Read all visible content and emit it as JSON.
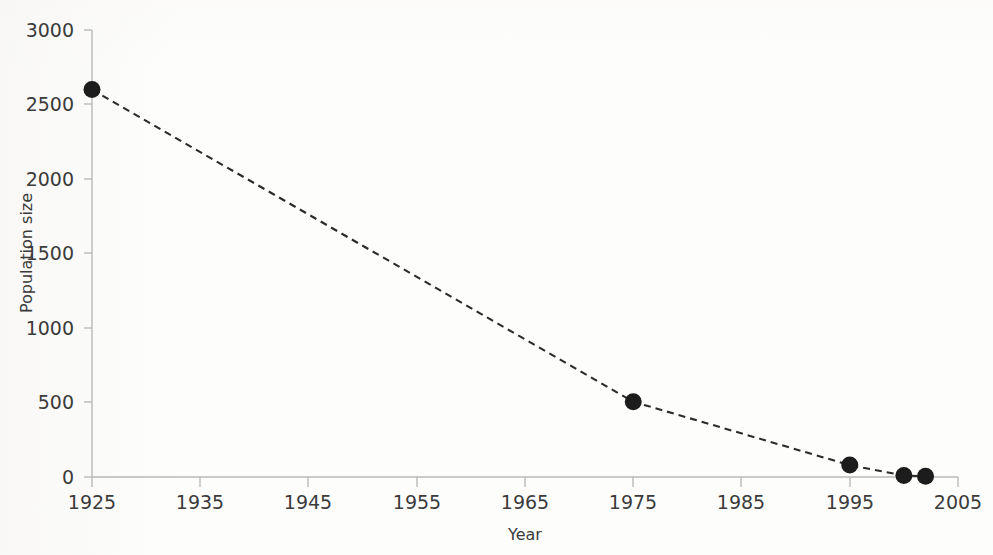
{
  "chart_data": {
    "type": "line",
    "title": "",
    "subtitle": "",
    "xlabel": "Year",
    "ylabel": "Population size",
    "xlim": [
      1925,
      2005
    ],
    "ylim": [
      0,
      3000
    ],
    "grid": false,
    "legend": null,
    "legend_position": "none",
    "line_style": "dashed",
    "marker": "filled-circle",
    "series_color": "#1c1c1c",
    "axis_color": "#b9b9b9",
    "text_color": "#3b3b3b",
    "background_color": "#fdfdfc",
    "x_ticks": [
      1925,
      1935,
      1945,
      1955,
      1965,
      1975,
      1985,
      1995,
      2005
    ],
    "x_tick_labels": [
      "1925",
      "1935",
      "1945",
      "1955",
      "1965",
      "1975",
      "1985",
      "1995",
      "2005"
    ],
    "y_ticks": [
      0,
      500,
      1000,
      1500,
      2000,
      2500,
      3000
    ],
    "y_tick_labels": [
      "0",
      "500",
      "1000",
      "1500",
      "2000",
      "2500",
      "3000"
    ],
    "x": [
      1925,
      1975,
      1995,
      2000,
      2002
    ],
    "values": [
      2600,
      505,
      80,
      10,
      5
    ],
    "points": [
      {
        "year": 1925,
        "population": 2600
      },
      {
        "year": 1975,
        "population": 505
      },
      {
        "year": 1995,
        "population": 80
      },
      {
        "year": 2000,
        "population": 10
      },
      {
        "year": 2002,
        "population": 5
      }
    ]
  },
  "axes": {
    "x_title": "Year",
    "y_title": "Population size"
  },
  "ticks": {
    "y": [
      "3000",
      "2500",
      "2000",
      "1500",
      "1000",
      "500",
      "0"
    ],
    "x": [
      "1925",
      "1935",
      "1945",
      "1955",
      "1965",
      "1975",
      "1985",
      "1995",
      "2005"
    ]
  }
}
